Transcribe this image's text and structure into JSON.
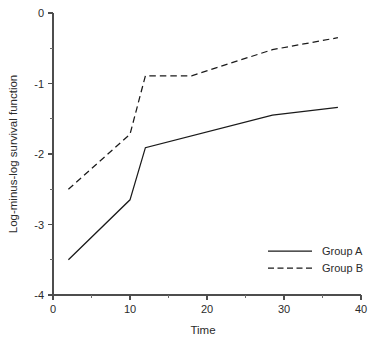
{
  "chart_data": {
    "type": "line",
    "title": "",
    "xlabel": "Time",
    "ylabel": "Log-minus-log survival function",
    "xlim": [
      0,
      40
    ],
    "ylim": [
      -4,
      0
    ],
    "grid": false,
    "legend_position": "bottom-right",
    "x_ticks_major": [
      0,
      10,
      20,
      30,
      40
    ],
    "x_ticks_major_labels": [
      "0",
      "10",
      "20",
      "30",
      "40"
    ],
    "x_ticks_minor": [
      5,
      15,
      25,
      35
    ],
    "y_ticks_major": [
      0,
      -1,
      -2,
      -3,
      -4
    ],
    "y_ticks_major_labels": [
      "0",
      "-1",
      "-2",
      "-3",
      "-4"
    ],
    "y_ticks_minor": [
      -0.5,
      -1.5,
      -2.5,
      -3.5
    ],
    "series": [
      {
        "name": "Group A",
        "style": "solid",
        "color": "#1a1a1a",
        "x": [
          2,
          10,
          12,
          28.5,
          37
        ],
        "y": [
          -3.5,
          -2.65,
          -1.91,
          -1.45,
          -1.34
        ]
      },
      {
        "name": "Group B",
        "style": "dashed",
        "color": "#1a1a1a",
        "x": [
          2,
          10,
          12,
          18,
          28.5,
          37
        ],
        "y": [
          -2.5,
          -1.72,
          -0.89,
          -0.89,
          -0.52,
          -0.35
        ]
      }
    ],
    "legend_entries": [
      {
        "label": "Group A",
        "style": "solid"
      },
      {
        "label": "Group B",
        "style": "dashed"
      }
    ]
  }
}
